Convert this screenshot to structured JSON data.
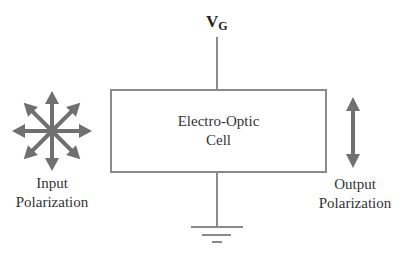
{
  "diagram": {
    "voltage_label": "V",
    "voltage_subscript": "G",
    "cell_label_line1": "Electro-Optic",
    "cell_label_line2": "Cell",
    "input_label_line1": "Input",
    "input_label_line2": "Polarization",
    "output_label_line1": "Output",
    "output_label_line2": "Polarization",
    "colors": {
      "line": "#8a8a8a",
      "arrow": "#707070",
      "text": "#333333"
    }
  }
}
